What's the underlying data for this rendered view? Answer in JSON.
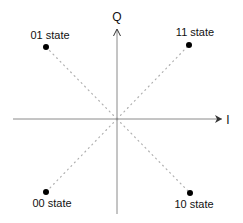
{
  "diagram": {
    "type": "constellation",
    "axes": {
      "horizontal_label": "I",
      "vertical_label": "Q",
      "axis_color": "#8a8a8a"
    },
    "guide_line_color": "#b0b0b0",
    "point_color": "#000000",
    "points": [
      {
        "label": "01 state",
        "quadrant": "upper-left"
      },
      {
        "label": "11 state",
        "quadrant": "upper-right"
      },
      {
        "label": "00 state",
        "quadrant": "lower-left"
      },
      {
        "label": "10 state",
        "quadrant": "lower-right"
      }
    ]
  }
}
